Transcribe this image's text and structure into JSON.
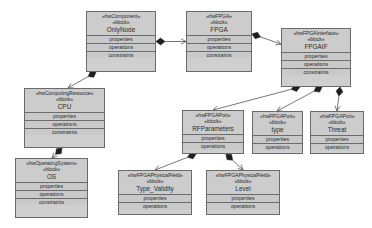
{
  "diagram": {
    "background_color": "#ffffff",
    "node_fill": "#cfcfcf",
    "node_border": "#6b6b6b",
    "edge_color": "#555555",
    "block_keyword": "«block»",
    "compartment_labels": {
      "properties": "properties",
      "operations": "operations",
      "constraints": "constraints"
    },
    "nodes": [
      {
        "id": "onlynode",
        "stereotype": "«hwComponent»",
        "keyword": "«block»",
        "name": "OnlyNode",
        "compartments": [
          "properties",
          "operations",
          "constraints"
        ],
        "x": 86,
        "y": 11,
        "w": 70,
        "h": 61
      },
      {
        "id": "fpga",
        "stereotype": "«hwFPGA»",
        "keyword": "«block»",
        "name": "FPGA",
        "compartments": [
          "properties",
          "operations",
          "constraints"
        ],
        "x": 186,
        "y": 11,
        "w": 66,
        "h": 61
      },
      {
        "id": "fpgaif",
        "stereotype": "«hwFPGAInterface»",
        "keyword": "«block»",
        "name": "FPGAIF",
        "compartments": [
          "properties",
          "operations",
          "constraints"
        ],
        "x": 281,
        "y": 28,
        "w": 70,
        "h": 59
      },
      {
        "id": "cpu",
        "stereotype": "«hwComputingResource»",
        "keyword": "«block»",
        "name": "CPU",
        "compartments": [
          "properties",
          "operations",
          "constraints"
        ],
        "x": 24,
        "y": 88,
        "w": 81,
        "h": 60
      },
      {
        "id": "os",
        "stereotype": "«hwOperatingSystem»",
        "keyword": "«block»",
        "name": "OS",
        "compartments": [
          "properties",
          "operations",
          "constraints"
        ],
        "x": 15,
        "y": 158,
        "w": 73,
        "h": 60
      },
      {
        "id": "rfparameters",
        "stereotype": "«hwFPGAPort»",
        "keyword": "«block»",
        "name": "RFParameters",
        "compartments": [
          "properties",
          "operations"
        ],
        "x": 182,
        "y": 110,
        "w": 62,
        "h": 44
      },
      {
        "id": "type",
        "stereotype": "«hwFPGAPort»",
        "keyword": "«block»",
        "name": "type",
        "compartments": [
          "properties",
          "operations"
        ],
        "x": 252,
        "y": 111,
        "w": 51,
        "h": 43
      },
      {
        "id": "threat",
        "stereotype": "«hwFPGAPort»",
        "keyword": "«block»",
        "name": "Threat",
        "compartments": [
          "properties",
          "operations"
        ],
        "x": 310,
        "y": 111,
        "w": 54,
        "h": 43
      },
      {
        "id": "typevalidity",
        "stereotype": "«hwFPGAPhysicalField»",
        "keyword": "«block»",
        "name": "Type_Validity",
        "compartments": [
          "properties",
          "operations"
        ],
        "x": 118,
        "y": 170,
        "w": 74,
        "h": 45
      },
      {
        "id": "level",
        "stereotype": "«hwFPGAPhysicalField»",
        "keyword": "«block»",
        "name": "Level",
        "compartments": [
          "properties",
          "operations"
        ],
        "x": 206,
        "y": 170,
        "w": 74,
        "h": 45
      }
    ],
    "edges": [
      {
        "id": "onlynode-fpga",
        "type": "composition",
        "from": "onlynode",
        "to": "fpga"
      },
      {
        "id": "onlynode-cpu",
        "type": "composition",
        "from": "onlynode",
        "to": "cpu"
      },
      {
        "id": "fpga-fpgaif",
        "type": "composition",
        "from": "fpga",
        "to": "fpgaif"
      },
      {
        "id": "cpu-os",
        "type": "composition",
        "from": "cpu",
        "to": "os"
      },
      {
        "id": "fpgaif-rfparameters",
        "type": "composition",
        "from": "fpgaif",
        "to": "rfparameters"
      },
      {
        "id": "fpgaif-type",
        "type": "composition",
        "from": "fpgaif",
        "to": "type"
      },
      {
        "id": "fpgaif-threat",
        "type": "composition",
        "from": "fpgaif",
        "to": "threat"
      },
      {
        "id": "rfparameters-typevalidity",
        "type": "composition",
        "from": "rfparameters",
        "to": "typevalidity"
      },
      {
        "id": "rfparameters-level",
        "type": "composition",
        "from": "rfparameters",
        "to": "level"
      }
    ]
  }
}
